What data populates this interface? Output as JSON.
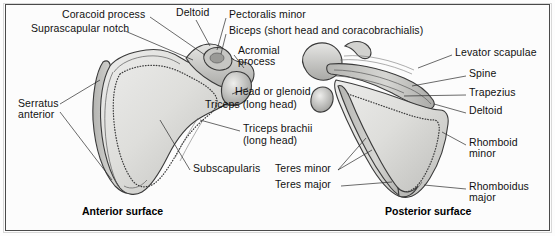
{
  "figure": {
    "captions": [
      {
        "text": "Anterior surface",
        "x": 82,
        "y": 205
      },
      {
        "text": "Posterior surface",
        "x": 385,
        "y": 205
      }
    ]
  },
  "labels": {
    "anterior": [
      {
        "id": "coracoid-process",
        "text": "Coracoid process",
        "x": 62,
        "y": 14
      },
      {
        "id": "suprascapular-notch",
        "text": "Suprascapular notch",
        "x": 31,
        "y": 28
      },
      {
        "id": "deltoid-anterior",
        "text": "Deltoid",
        "x": 176,
        "y": 12
      },
      {
        "id": "pectoralis-minor",
        "text": "Pectoralis minor",
        "x": 229,
        "y": 14
      },
      {
        "id": "biceps",
        "text": "Biceps (short head and coracobrachialis)",
        "x": 229,
        "y": 30
      },
      {
        "id": "acromial-process",
        "text": "Acromial",
        "x": 238,
        "y": 50
      },
      {
        "id": "acromial-process-2",
        "text": "process",
        "x": 238,
        "y": 61
      },
      {
        "id": "serratus-anterior",
        "text": "Serratus",
        "x": 18,
        "y": 103
      },
      {
        "id": "serratus-anterior-2",
        "text": "anterior",
        "x": 18,
        "y": 114
      },
      {
        "id": "head-or-glenoid",
        "text": "Head or glenoid",
        "x": 235,
        "y": 91
      },
      {
        "id": "triceps-long-head",
        "text": "Triceps (long head)",
        "x": 222,
        "y": 104
      },
      {
        "id": "triceps-brachii",
        "text": "Triceps brachii",
        "x": 243,
        "y": 128
      },
      {
        "id": "triceps-brachii-2",
        "text": "(long head)",
        "x": 243,
        "y": 140
      },
      {
        "id": "subscapularis",
        "text": "Subscapularis",
        "x": 193,
        "y": 168
      }
    ],
    "posterior": [
      {
        "id": "levator-scapulae",
        "text": "Levator scapulae",
        "x": 455,
        "y": 52
      },
      {
        "id": "spine",
        "text": "Spine",
        "x": 469,
        "y": 73
      },
      {
        "id": "trapezius",
        "text": "Trapezius",
        "x": 469,
        "y": 92
      },
      {
        "id": "deltoid-posterior",
        "text": "Deltoid",
        "x": 469,
        "y": 110
      },
      {
        "id": "rhomboid-minor",
        "text": "Rhomboid",
        "x": 469,
        "y": 142
      },
      {
        "id": "rhomboid-minor-2",
        "text": "minor",
        "x": 469,
        "y": 153
      },
      {
        "id": "teres-minor",
        "text": "Teres minor",
        "x": 288,
        "y": 168
      },
      {
        "id": "teres-major",
        "text": "Teres major",
        "x": 288,
        "y": 184
      },
      {
        "id": "rhomboidus-major",
        "text": "Rhomboidus",
        "x": 469,
        "y": 186
      },
      {
        "id": "rhomboidus-major-2",
        "text": "major",
        "x": 469,
        "y": 197
      }
    ]
  },
  "colors": {
    "frame": "#4a4a4a",
    "background": "#fcfcfc",
    "bone_light": "#e3e3e0",
    "bone_mid": "#c9c9c6",
    "bone_dark": "#a8a8a5",
    "text": "#111111",
    "leader": "#2b2b2b"
  }
}
